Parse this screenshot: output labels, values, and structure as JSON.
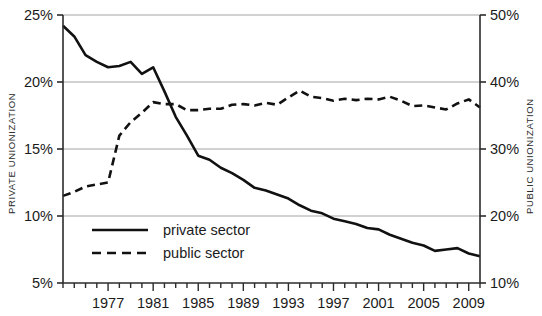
{
  "chart_data": {
    "type": "line",
    "title": "",
    "xlabel": "",
    "ylabel": "PRIVATE UNIONIZATION",
    "y2label": "PUBLIC UNIONIZATION",
    "grid": true,
    "legend_position": "inside-bottom-left",
    "xlim": [
      1973,
      2010
    ],
    "ylim": [
      5,
      25
    ],
    "y2lim": [
      10,
      50
    ],
    "x_tick_labels": [
      "1977",
      "1981",
      "1985",
      "1989",
      "1993",
      "1997",
      "2001",
      "2005",
      "2009"
    ],
    "x_tick_values": [
      1977,
      1981,
      1985,
      1989,
      1993,
      1997,
      2001,
      2005,
      2009
    ],
    "x_minor_ticks_every": 1,
    "y_tick_labels": [
      "25%",
      "20%",
      "15%",
      "10%",
      "5%"
    ],
    "y_tick_values": [
      25,
      20,
      15,
      10,
      5
    ],
    "y2_tick_labels": [
      "50%",
      "40%",
      "30%",
      "20%",
      "10%"
    ],
    "y2_tick_values": [
      50,
      40,
      30,
      20,
      10
    ],
    "x": [
      1973,
      1974,
      1975,
      1976,
      1977,
      1978,
      1979,
      1980,
      1981,
      1982,
      1983,
      1984,
      1985,
      1986,
      1987,
      1988,
      1989,
      1990,
      1991,
      1992,
      1993,
      1994,
      1995,
      1996,
      1997,
      1998,
      1999,
      2000,
      2001,
      2002,
      2003,
      2004,
      2005,
      2006,
      2007,
      2008,
      2009,
      2010
    ],
    "series": [
      {
        "name": "private sector",
        "axis": "left",
        "style": "solid",
        "color": "#111111",
        "values": [
          24.2,
          23.4,
          22.0,
          21.5,
          21.1,
          21.2,
          21.5,
          20.6,
          21.1,
          19.3,
          17.4,
          16.0,
          14.5,
          14.2,
          13.6,
          13.2,
          12.7,
          12.1,
          11.9,
          11.6,
          11.3,
          10.8,
          10.4,
          10.2,
          9.8,
          9.6,
          9.4,
          9.1,
          9.0,
          8.6,
          8.3,
          8.0,
          7.8,
          7.4,
          7.5,
          7.6,
          7.2,
          7.0
        ]
      },
      {
        "name": "public sector",
        "axis": "right",
        "style": "dashed",
        "color": "#111111",
        "values": [
          23.0,
          23.6,
          24.4,
          24.7,
          25.0,
          32.0,
          34.0,
          35.4,
          37.0,
          36.7,
          36.7,
          35.8,
          35.8,
          36.0,
          36.0,
          36.6,
          36.7,
          36.5,
          36.9,
          36.6,
          37.7,
          38.7,
          37.8,
          37.6,
          37.2,
          37.5,
          37.3,
          37.5,
          37.4,
          37.8,
          37.2,
          36.4,
          36.5,
          36.2,
          35.9,
          36.8,
          37.4,
          36.2
        ]
      }
    ],
    "legend_entries": [
      {
        "label": "private sector",
        "style": "solid"
      },
      {
        "label": "public sector",
        "style": "dashed"
      }
    ]
  }
}
